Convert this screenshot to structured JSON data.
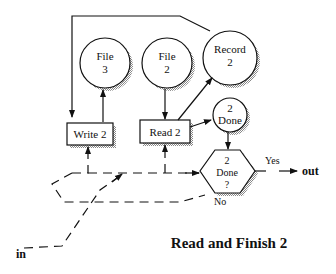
{
  "diagram": {
    "title": "Read and Finish 2",
    "nodes": {
      "file3": {
        "line1": "File",
        "line2": "3"
      },
      "file2": {
        "line1": "File",
        "line2": "2"
      },
      "record2": {
        "line1": "Record",
        "line2": "2"
      },
      "done2": {
        "line1": "2",
        "line2": "Done"
      },
      "write2": {
        "label": "Write 2"
      },
      "read2": {
        "label": "Read 2"
      },
      "decision": {
        "line1": "2",
        "line2": "Done",
        "line3": "?"
      }
    },
    "edge_labels": {
      "yes": "Yes",
      "no": "No",
      "in": "in",
      "out": "out"
    }
  }
}
